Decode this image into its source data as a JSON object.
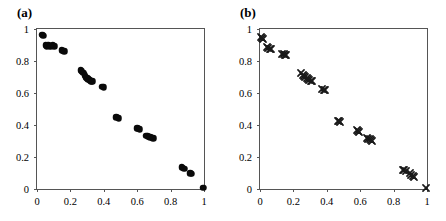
{
  "figure": {
    "background_color": "#ffffff",
    "marker_color": "#0a0a0a",
    "axis_color": "#555555"
  },
  "chart_data": [
    {
      "type": "scatter",
      "panel_label": "(a)",
      "title": "",
      "xlabel": "",
      "ylabel": "",
      "xlim": [
        0,
        1
      ],
      "ylim": [
        0,
        1
      ],
      "grid": false,
      "legend": null,
      "marker": "filled-circle",
      "marker_color": "#0a0a0a",
      "xticks": [
        0,
        0.2,
        0.4,
        0.6,
        0.8,
        1
      ],
      "xtick_labels": [
        "0",
        "0.2",
        "0.4",
        "0.6",
        "0.8",
        "1"
      ],
      "yticks": [
        0,
        0.2,
        0.4,
        0.6,
        0.8,
        1
      ],
      "ytick_labels": [
        "0",
        "0.2",
        "0.4",
        "0.6",
        "0.8",
        "1"
      ],
      "points": [
        [
          0.03,
          0.965
        ],
        [
          0.037,
          0.958
        ],
        [
          0.052,
          0.9
        ],
        [
          0.058,
          0.893
        ],
        [
          0.066,
          0.898
        ],
        [
          0.078,
          0.89
        ],
        [
          0.086,
          0.895
        ],
        [
          0.095,
          0.897
        ],
        [
          0.103,
          0.893
        ],
        [
          0.148,
          0.868
        ],
        [
          0.156,
          0.864
        ],
        [
          0.163,
          0.862
        ],
        [
          0.262,
          0.742
        ],
        [
          0.268,
          0.735
        ],
        [
          0.276,
          0.728
        ],
        [
          0.285,
          0.712
        ],
        [
          0.292,
          0.7
        ],
        [
          0.3,
          0.692
        ],
        [
          0.308,
          0.686
        ],
        [
          0.316,
          0.68
        ],
        [
          0.324,
          0.675
        ],
        [
          0.332,
          0.672
        ],
        [
          0.392,
          0.64
        ],
        [
          0.399,
          0.637
        ],
        [
          0.476,
          0.45
        ],
        [
          0.483,
          0.445
        ],
        [
          0.49,
          0.442
        ],
        [
          0.6,
          0.38
        ],
        [
          0.607,
          0.376
        ],
        [
          0.614,
          0.372
        ],
        [
          0.655,
          0.334
        ],
        [
          0.663,
          0.33
        ],
        [
          0.671,
          0.326
        ],
        [
          0.679,
          0.323
        ],
        [
          0.687,
          0.32
        ],
        [
          0.695,
          0.318
        ],
        [
          0.866,
          0.136
        ],
        [
          0.874,
          0.132
        ],
        [
          0.882,
          0.128
        ],
        [
          0.918,
          0.098
        ],
        [
          0.926,
          0.094
        ],
        [
          0.995,
          0.008
        ]
      ]
    },
    {
      "type": "scatter",
      "panel_label": "(b)",
      "title": "",
      "xlabel": "",
      "ylabel": "",
      "xlim": [
        0,
        1
      ],
      "ylim": [
        0,
        1
      ],
      "grid": false,
      "legend": null,
      "marker": "cross-x",
      "marker_color": "#1a1a1a",
      "xticks": [
        0,
        0.2,
        0.4,
        0.6,
        0.8,
        1
      ],
      "xtick_labels": [
        "0",
        "0.2",
        "0.4",
        "0.6",
        "0.8",
        "1"
      ],
      "yticks": [
        0,
        0.2,
        0.4,
        0.6,
        0.8,
        1
      ],
      "ytick_labels": [
        "0",
        "0.2",
        "0.4",
        "0.6",
        "0.8",
        "1"
      ],
      "points": [
        [
          0.006,
          0.952
        ],
        [
          0.012,
          0.944
        ],
        [
          0.018,
          0.936
        ],
        [
          0.042,
          0.886
        ],
        [
          0.05,
          0.88
        ],
        [
          0.058,
          0.874
        ],
        [
          0.066,
          0.872
        ],
        [
          0.134,
          0.846
        ],
        [
          0.142,
          0.842
        ],
        [
          0.15,
          0.838
        ],
        [
          0.158,
          0.836
        ],
        [
          0.248,
          0.722
        ],
        [
          0.256,
          0.714
        ],
        [
          0.264,
          0.706
        ],
        [
          0.272,
          0.7
        ],
        [
          0.28,
          0.692
        ],
        [
          0.288,
          0.686
        ],
        [
          0.296,
          0.68
        ],
        [
          0.304,
          0.676
        ],
        [
          0.312,
          0.672
        ],
        [
          0.374,
          0.624
        ],
        [
          0.382,
          0.62
        ],
        [
          0.39,
          0.616
        ],
        [
          0.466,
          0.428
        ],
        [
          0.474,
          0.424
        ],
        [
          0.482,
          0.42
        ],
        [
          0.578,
          0.366
        ],
        [
          0.586,
          0.36
        ],
        [
          0.594,
          0.354
        ],
        [
          0.64,
          0.32
        ],
        [
          0.648,
          0.314
        ],
        [
          0.656,
          0.31
        ],
        [
          0.664,
          0.306
        ],
        [
          0.672,
          0.302
        ],
        [
          0.856,
          0.12
        ],
        [
          0.864,
          0.116
        ],
        [
          0.872,
          0.112
        ],
        [
          0.898,
          0.098
        ],
        [
          0.906,
          0.09
        ],
        [
          0.914,
          0.082
        ],
        [
          0.922,
          0.076
        ],
        [
          0.996,
          0.006
        ]
      ]
    }
  ]
}
